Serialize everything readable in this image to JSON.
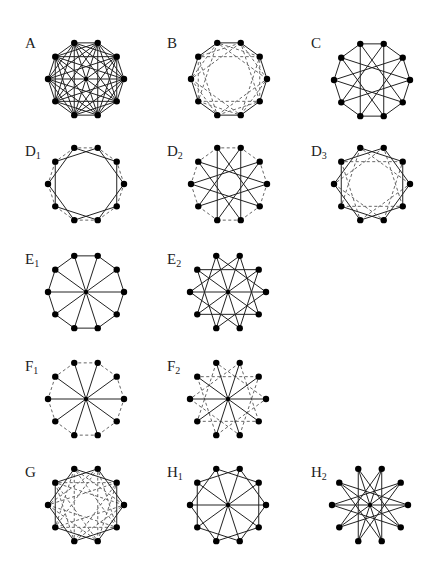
{
  "figure": {
    "vertex_count": 10,
    "radius": 38,
    "stroke_color": "#222222",
    "dash_color": "#555555",
    "vertex_color": "#000000",
    "graphs": [
      {
        "id": "A",
        "label": "A",
        "sub": "",
        "cx": 86,
        "cy": 79,
        "lx": 25,
        "ly": 36,
        "solid": [
          1,
          2,
          3,
          4,
          5
        ],
        "dashed": []
      },
      {
        "id": "B",
        "label": "B",
        "sub": "",
        "cx": 229,
        "cy": 79,
        "lx": 167,
        "ly": 36,
        "solid": [
          1
        ],
        "dashed": [
          2,
          3
        ]
      },
      {
        "id": "C",
        "label": "C",
        "sub": "",
        "cx": 372,
        "cy": 80,
        "lx": 311,
        "ly": 36,
        "solid": [
          1,
          4
        ],
        "dashed": []
      },
      {
        "id": "D1",
        "label": "D",
        "sub": "1",
        "cx": 86,
        "cy": 184,
        "lx": 25,
        "ly": 144,
        "solid": [
          2
        ],
        "dashed": [
          1
        ]
      },
      {
        "id": "D2",
        "label": "D",
        "sub": "2",
        "cx": 229,
        "cy": 184,
        "lx": 167,
        "ly": 144,
        "solid": [
          4
        ],
        "dashed": [
          1
        ]
      },
      {
        "id": "D3",
        "label": "D",
        "sub": "3",
        "cx": 372,
        "cy": 184,
        "lx": 311,
        "ly": 144,
        "solid": [
          2
        ],
        "dashed": [
          3
        ]
      },
      {
        "id": "E1",
        "label": "E",
        "sub": "1",
        "cx": 86,
        "cy": 292,
        "lx": 25,
        "ly": 252,
        "solid": [
          1,
          5
        ],
        "dashed": []
      },
      {
        "id": "E2",
        "label": "E",
        "sub": "2",
        "cx": 228,
        "cy": 292,
        "lx": 167,
        "ly": 252,
        "solid": [
          3,
          5
        ],
        "dashed": []
      },
      {
        "id": "F1",
        "label": "F",
        "sub": "1",
        "cx": 86,
        "cy": 399,
        "lx": 25,
        "ly": 359,
        "solid": [
          5
        ],
        "dashed": [
          1
        ]
      },
      {
        "id": "F2",
        "label": "F",
        "sub": "2",
        "cx": 228,
        "cy": 399,
        "lx": 167,
        "ly": 359,
        "solid": [
          5
        ],
        "dashed": [
          3
        ]
      },
      {
        "id": "G",
        "label": "G",
        "sub": "",
        "cx": 86,
        "cy": 505,
        "lx": 25,
        "ly": 465,
        "solid": [
          2
        ],
        "dashed": [
          3,
          4
        ]
      },
      {
        "id": "H1",
        "label": "H",
        "sub": "1",
        "cx": 228,
        "cy": 505,
        "lx": 167,
        "ly": 465,
        "solid": [
          2,
          5
        ],
        "dashed": []
      },
      {
        "id": "H2",
        "label": "H",
        "sub": "2",
        "cx": 370,
        "cy": 505,
        "lx": 311,
        "ly": 465,
        "solid": [
          4,
          5
        ],
        "dashed": []
      }
    ]
  }
}
